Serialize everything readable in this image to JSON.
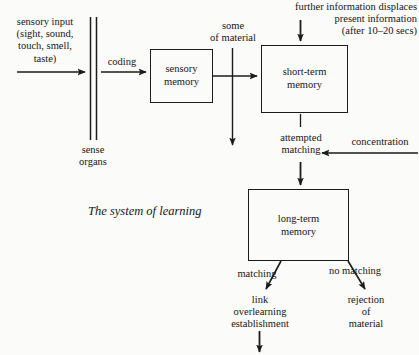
{
  "figure": {
    "caption": "The system of learning",
    "boxes": {
      "sensory_memory": "sensory\nmemory",
      "short_term_memory": "short-term\nmemory",
      "long_term_memory": "long-term\nmemory"
    },
    "labels": {
      "sensory_input": "sensory input\n(sight, sound,\ntouch, smell,\ntaste)",
      "sense_organs": "sense\norgans",
      "coding": "coding",
      "some_of_material": "some\nof material",
      "further_information": "further information displaces\npresent information\n(after 10–20 secs)",
      "attempted_matching": "attempted\nmatching",
      "concentration": "concentration",
      "matching": "matching",
      "no_matching": "no matching",
      "link_overlearning": "link\noverlearning\nestablishment",
      "rejection_of_material": "rejection\nof\nmaterial"
    },
    "colors": {
      "background": "#fbfbfa",
      "ink": "#1b1b1b",
      "text": "#161616"
    }
  }
}
